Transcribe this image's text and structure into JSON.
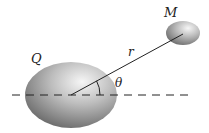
{
  "diagram": {
    "labels": {
      "large_body": "Q",
      "small_body": "M",
      "distance": "r",
      "angle": "θ"
    },
    "colors": {
      "sphere_light": "#f4f4f4",
      "sphere_mid": "#b8b8b8",
      "sphere_dark": "#6e6e6e",
      "line": "#222222",
      "background": "#ffffff"
    }
  }
}
